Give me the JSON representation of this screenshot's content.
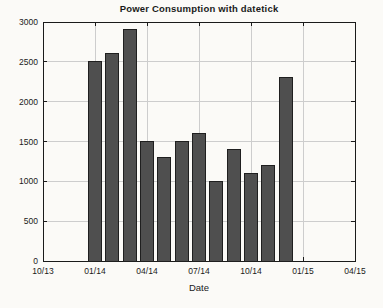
{
  "chart_data": {
    "type": "bar",
    "title": "Power Consumption with datetick",
    "xlabel": "Date",
    "ylabel": "",
    "x_axis": {
      "tick_labels": [
        "10/13",
        "01/14",
        "04/14",
        "07/14",
        "10/14",
        "01/15",
        "04/15"
      ],
      "tick_positions_months": [
        0,
        3,
        6,
        9,
        12,
        15,
        18
      ],
      "range_months": [
        0,
        18
      ]
    },
    "y_axis": {
      "ticks": [
        0,
        500,
        1000,
        1500,
        2000,
        2500,
        3000
      ],
      "range": [
        0,
        3000
      ]
    },
    "bars": {
      "categories": [
        "01/14",
        "02/14",
        "03/14",
        "04/14",
        "05/14",
        "06/14",
        "07/14",
        "08/14",
        "09/14",
        "10/14",
        "11/14",
        "12/14"
      ],
      "positions_months": [
        3,
        4,
        5,
        6,
        7,
        8,
        9,
        10,
        11,
        12,
        13,
        14
      ],
      "values": [
        2500,
        2600,
        2900,
        1500,
        1300,
        1500,
        1600,
        1000,
        1400,
        1100,
        1200,
        2300
      ]
    },
    "grid": true,
    "legend": "none",
    "colors": {
      "bar_fill": "#4f4f4f",
      "bar_edge": "#1f1f1f",
      "grid": "#cdcdcd",
      "axis": "#1a1a1a",
      "text": "#1a1a1a",
      "background": "#fbfaf7"
    }
  }
}
